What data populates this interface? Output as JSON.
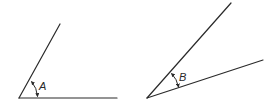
{
  "diagram": {
    "type": "angles",
    "stroke_color": "#2a2a2a",
    "background": "#ffffff",
    "angles": [
      {
        "label": "A",
        "vertex": [
          19,
          98
        ],
        "ray1_end": [
          60,
          24
        ],
        "ray2_end": [
          117,
          98
        ],
        "description": "wider angle with horizontal base"
      },
      {
        "label": "B",
        "vertex": [
          147,
          98
        ],
        "ray1_end": [
          231,
          3
        ],
        "ray2_end": [
          263,
          60
        ],
        "description": "narrower angle, both rays rising to the right"
      }
    ]
  }
}
